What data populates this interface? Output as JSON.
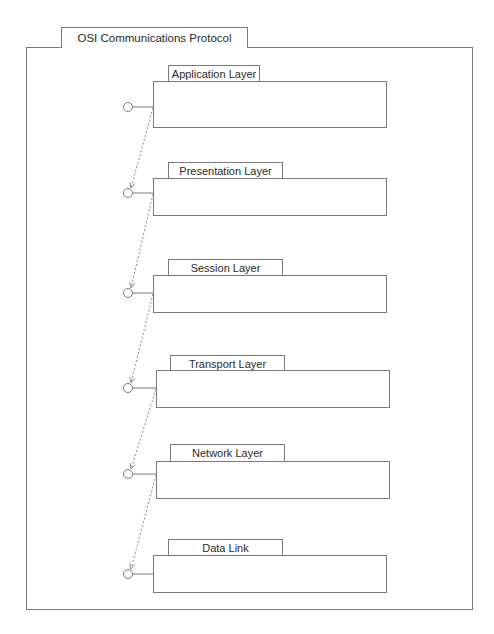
{
  "package": {
    "title": "OSI Communications Protocol",
    "frame": {
      "x": 26,
      "y": 47,
      "w": 447,
      "h": 563
    },
    "tab": {
      "x": 61,
      "y": 27,
      "w": 187,
      "h": 21
    }
  },
  "layers": [
    {
      "name": "Application Layer",
      "tab": {
        "x": 168,
        "y": 65,
        "w": 92,
        "h": 17
      },
      "box": {
        "x": 153,
        "y": 81,
        "w": 234,
        "h": 47
      },
      "port": {
        "cx": 128,
        "cy": 107
      }
    },
    {
      "name": "Presentation Layer",
      "tab": {
        "x": 168,
        "y": 162,
        "w": 115,
        "h": 17
      },
      "box": {
        "x": 153,
        "y": 178,
        "w": 234,
        "h": 38
      },
      "port": {
        "cx": 128,
        "cy": 193
      }
    },
    {
      "name": "Session Layer",
      "tab": {
        "x": 168,
        "y": 259,
        "w": 115,
        "h": 17
      },
      "box": {
        "x": 153,
        "y": 275,
        "w": 234,
        "h": 38
      },
      "port": {
        "cx": 128,
        "cy": 293
      }
    },
    {
      "name": "Transport Layer",
      "tab": {
        "x": 170,
        "y": 355,
        "w": 115,
        "h": 16
      },
      "box": {
        "x": 156,
        "y": 370,
        "w": 234,
        "h": 38
      },
      "port": {
        "cx": 128,
        "cy": 388
      }
    },
    {
      "name": "Network Layer",
      "tab": {
        "x": 170,
        "y": 444,
        "w": 115,
        "h": 18
      },
      "box": {
        "x": 156,
        "y": 461,
        "w": 234,
        "h": 38
      },
      "port": {
        "cx": 128,
        "cy": 474
      }
    },
    {
      "name": "Data Link",
      "tab": {
        "x": 168,
        "y": 539,
        "w": 115,
        "h": 17
      },
      "box": {
        "x": 153,
        "y": 555,
        "w": 234,
        "h": 38
      },
      "port": {
        "cx": 128,
        "cy": 574
      }
    }
  ],
  "colors": {
    "line": "#7a7a7a",
    "dash": "#8a8a8a"
  }
}
